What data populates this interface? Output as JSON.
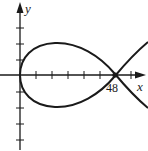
{
  "diagram": {
    "x_axis_label": "x",
    "y_axis_label": "y",
    "crossing_label": "48",
    "colors": {
      "stroke": "#1a1a1a",
      "background": "#ffffff"
    },
    "x_ticks_count": 7,
    "y_ticks_above": 3,
    "y_ticks_below": 4,
    "curve": "closed loop from origin crossing itself on x-axis at x=48, branches continuing to the right"
  }
}
